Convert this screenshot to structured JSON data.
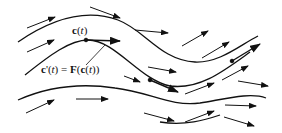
{
  "diagram": {
    "labels": {
      "curve": {
        "fn": "c",
        "open": "(",
        "var": "t",
        "close": ")"
      },
      "equation": {
        "lhs_fn": "c",
        "prime": "'",
        "lhs_open": "(",
        "lhs_var": "t",
        "lhs_close": ")",
        "equals": " = ",
        "field": "F",
        "rhs_open": "(",
        "inner_fn": "c",
        "inner_open": "(",
        "inner_var": "t",
        "inner_close": "))"
      }
    },
    "colors": {
      "stroke": "#111111",
      "background": "#ffffff"
    },
    "flow_lines": 4,
    "vector_arrows": 17
  }
}
